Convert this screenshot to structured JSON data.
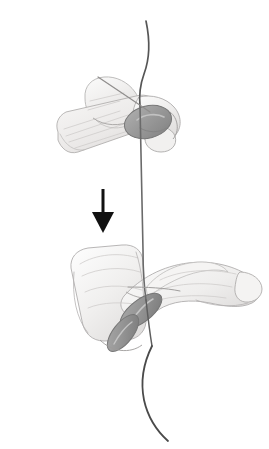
{
  "figure": {
    "description": "Grayscale pencil illustration: an upper hand grips a thread between thumb and finger while a lower hand holds the same thread below; a solid black downward arrow between them indicates the pulling direction.",
    "background_color": "#ffffff",
    "canvas": {
      "width": 269,
      "height": 449
    }
  },
  "palette": {
    "background": "#ffffff",
    "thread_stroke": "#5a5a5a",
    "thread_stroke_dark": "#3f3f3f",
    "outline_stroke": "#9a9a9a",
    "outline_stroke_soft": "#b4b4b4",
    "skin_fill": "#f4f3f2",
    "skin_shade_light": "#ebeaea",
    "skin_shade_mid": "#dcdbda",
    "nail_fill": "#9b9b9b",
    "nail_fill_light": "#b6b6b6",
    "nail_outline": "#7a7a7a",
    "arrow_fill": "#111111"
  },
  "elements": {
    "upper_hand": {
      "name": "Upper hand",
      "role": "Grips the thread between thumb and index finger above",
      "nail_count": 1
    },
    "lower_hand": {
      "name": "Lower hand",
      "role": "Holds the thread below, index finger extending to the right",
      "nail_count": 2
    },
    "thread": {
      "name": "Thread",
      "role": "Single continuous thread running vertically through both hands",
      "segments": [
        "top curved tail",
        "straight middle run",
        "bottom curved tail"
      ]
    },
    "cross_strand": {
      "name": "Crossing strand",
      "role": "Short diagonal thread end crossing the upper hand"
    },
    "arrow": {
      "name": "Direction arrow",
      "direction": "down",
      "meaning": "Pull downward",
      "color": "#111111",
      "shaft_width_px": 3,
      "head_width_px": 22,
      "head_height_px": 21
    }
  }
}
